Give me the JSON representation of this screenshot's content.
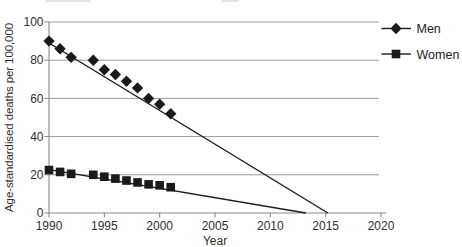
{
  "colors": {
    "grid": "#9b9b9b",
    "axis": "#8a8a8a",
    "text": "#2f2f2f",
    "series": "#1a1a1a",
    "background": "#ffffff"
  },
  "chart_data": {
    "type": "line",
    "title": "",
    "xlabel": "Year",
    "ylabel": "Age-standardised deaths per 100,000",
    "xlim": [
      1990,
      2020
    ],
    "ylim": [
      0,
      100
    ],
    "x_ticks": [
      1990,
      1995,
      2000,
      2005,
      2010,
      2015,
      2020
    ],
    "y_ticks": [
      0,
      20,
      40,
      60,
      80,
      100
    ],
    "grid": "horizontal",
    "legend_position": "top-right",
    "series": [
      {
        "name": "Men",
        "marker": "diamond",
        "color": "#1a1a1a",
        "x": [
          1990,
          1991,
          1992,
          1994,
          1995,
          1996,
          1997,
          1998,
          1999,
          2000,
          2001
        ],
        "values": [
          90,
          86,
          81.5,
          80,
          75,
          72.5,
          69,
          65.5,
          60,
          57,
          52
        ],
        "trend_line": {
          "from": [
            1990,
            89
          ],
          "to": [
            2015.2,
            0
          ]
        }
      },
      {
        "name": "Women",
        "marker": "square",
        "color": "#1a1a1a",
        "x": [
          1990,
          1991,
          1992,
          1994,
          1995,
          1996,
          1997,
          1998,
          1999,
          2000,
          2001
        ],
        "values": [
          22.5,
          21.5,
          20.5,
          20,
          19,
          18,
          17,
          16,
          15,
          14.5,
          13.5
        ],
        "trend_line": {
          "from": [
            1990,
            22.7
          ],
          "to": [
            2013.2,
            0
          ]
        }
      }
    ]
  }
}
